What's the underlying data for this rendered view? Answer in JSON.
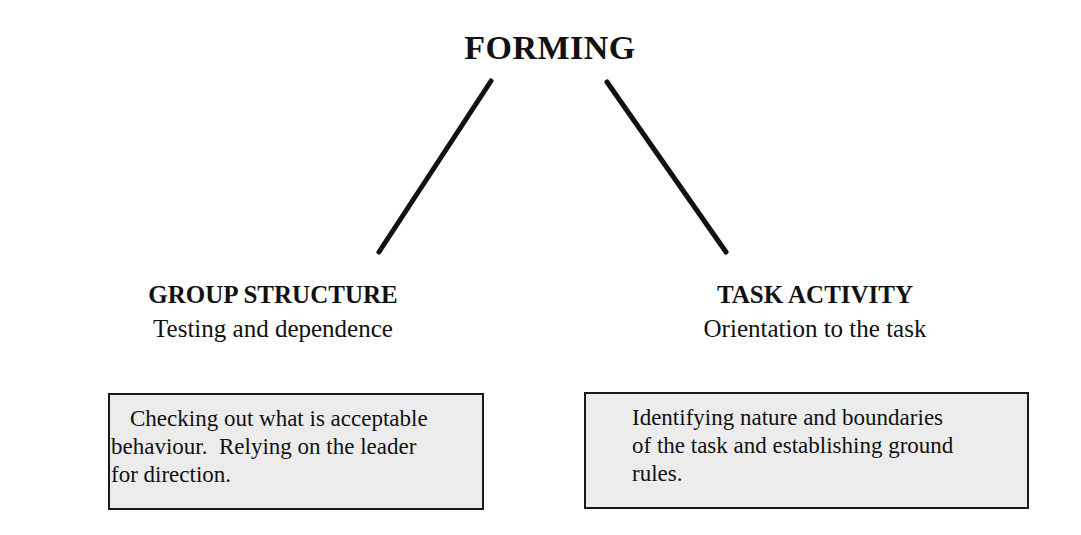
{
  "diagram": {
    "title": "FORMING",
    "branches": [
      {
        "heading": "GROUP STRUCTURE",
        "subheading": "Testing and dependence",
        "description_lines": [
          "Checking out what is acceptable",
          "behaviour.  Relying on the leader",
          "for direction."
        ]
      },
      {
        "heading": "TASK ACTIVITY",
        "subheading": "Orientation to the task",
        "description_lines": [
          "Identifying nature and boundaries",
          "of the task and establishing ground",
          "rules."
        ]
      }
    ],
    "colors": {
      "line": "#111111",
      "box_fill": "#ececec",
      "box_border": "#1a1a1a"
    }
  }
}
